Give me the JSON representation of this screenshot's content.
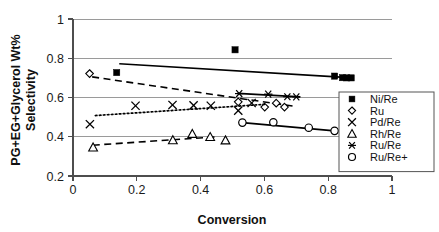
{
  "chart_data": {
    "type": "scatter",
    "title": "",
    "xlabel": "Conversion",
    "ylabel": "PG+EG+Glycerol Wt% Selectivity",
    "ylabel_line1": "PG+EG+Glycerol Wt%",
    "ylabel_line2": "Selectivity",
    "xlim": [
      0,
      1
    ],
    "ylim": [
      0.2,
      1
    ],
    "xticks": [
      "0",
      "0.2",
      "0.4",
      "0.6",
      "0.8",
      "1"
    ],
    "xtick_values": [
      0,
      0.2,
      0.4,
      0.6,
      0.8,
      1
    ],
    "yticks": [
      "0.2",
      "0.4",
      "0.6",
      "0.8",
      "1"
    ],
    "ytick_values": [
      0.2,
      0.4,
      0.6,
      0.8,
      1
    ],
    "grid": "horizontal",
    "legend_position": "right-middle",
    "series": [
      {
        "name": "Ni/Re",
        "marker": "filled-square",
        "line": "solid",
        "points": [
          {
            "x": 0.137,
            "y": 0.727
          },
          {
            "x": 0.508,
            "y": 0.843
          },
          {
            "x": 0.82,
            "y": 0.709
          },
          {
            "x": 0.845,
            "y": 0.701
          },
          {
            "x": 0.858,
            "y": 0.7
          },
          {
            "x": 0.872,
            "y": 0.7
          }
        ],
        "trendline": [
          {
            "x": 0.145,
            "y": 0.772
          },
          {
            "x": 0.878,
            "y": 0.7
          }
        ]
      },
      {
        "name": "Ru",
        "marker": "open-diamond",
        "line": "dashed",
        "points": [
          {
            "x": 0.052,
            "y": 0.722
          },
          {
            "x": 0.518,
            "y": 0.578
          },
          {
            "x": 0.601,
            "y": 0.551
          },
          {
            "x": 0.637,
            "y": 0.571
          },
          {
            "x": 0.663,
            "y": 0.551
          }
        ],
        "trendline": [
          {
            "x": 0.06,
            "y": 0.705
          },
          {
            "x": 0.69,
            "y": 0.556
          }
        ]
      },
      {
        "name": "Pd/Re",
        "marker": "cross-x",
        "line": "dotted",
        "points": [
          {
            "x": 0.053,
            "y": 0.464
          },
          {
            "x": 0.196,
            "y": 0.558
          },
          {
            "x": 0.312,
            "y": 0.562
          },
          {
            "x": 0.378,
            "y": 0.56
          },
          {
            "x": 0.432,
            "y": 0.558
          },
          {
            "x": 0.518,
            "y": 0.533
          },
          {
            "x": 0.56,
            "y": 0.572
          }
        ],
        "trendline": [
          {
            "x": 0.07,
            "y": 0.508
          },
          {
            "x": 0.6,
            "y": 0.565
          }
        ]
      },
      {
        "name": "Rh/Re",
        "marker": "open-triangle",
        "line": "dashed",
        "points": [
          {
            "x": 0.063,
            "y": 0.346
          },
          {
            "x": 0.313,
            "y": 0.383
          },
          {
            "x": 0.374,
            "y": 0.415
          },
          {
            "x": 0.43,
            "y": 0.399
          },
          {
            "x": 0.478,
            "y": 0.382
          }
        ],
        "trendline": [
          {
            "x": 0.062,
            "y": 0.357
          },
          {
            "x": 0.452,
            "y": 0.4
          }
        ]
      },
      {
        "name": "Ru/Re",
        "marker": "asterisk",
        "line": "solid",
        "points": [
          {
            "x": 0.521,
            "y": 0.62
          },
          {
            "x": 0.612,
            "y": 0.617
          },
          {
            "x": 0.672,
            "y": 0.604
          },
          {
            "x": 0.7,
            "y": 0.603
          }
        ],
        "trendline": [
          {
            "x": 0.516,
            "y": 0.621
          },
          {
            "x": 0.712,
            "y": 0.603
          }
        ]
      },
      {
        "name": "Ru/Re+",
        "marker": "open-circle",
        "line": "solid",
        "points": [
          {
            "x": 0.531,
            "y": 0.472
          },
          {
            "x": 0.628,
            "y": 0.474
          },
          {
            "x": 0.739,
            "y": 0.446
          },
          {
            "x": 0.82,
            "y": 0.43
          }
        ],
        "trendline": [
          {
            "x": 0.531,
            "y": 0.472
          },
          {
            "x": 0.82,
            "y": 0.43
          }
        ]
      }
    ]
  },
  "legend": {
    "entries": [
      {
        "label": "Ni/Re",
        "marker": "filled-square"
      },
      {
        "label": "Ru",
        "marker": "open-diamond"
      },
      {
        "label": "Pd/Re",
        "marker": "cross-x"
      },
      {
        "label": "Rh/Re",
        "marker": "open-triangle"
      },
      {
        "label": "Ru/Re",
        "marker": "asterisk"
      },
      {
        "label": "Ru/Re+",
        "marker": "open-circle"
      }
    ]
  },
  "colors": {
    "ink": "#000000",
    "grid": "#9a9a9a",
    "axis": "#4d4d4d",
    "background": "#ffffff"
  }
}
